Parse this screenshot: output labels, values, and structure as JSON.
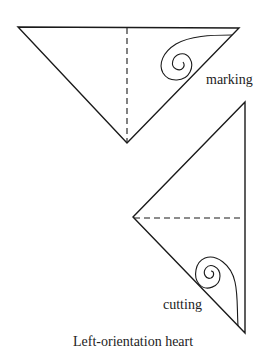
{
  "labels": {
    "marking": "marking",
    "cutting": "cutting",
    "caption": "Left-orientation heart"
  },
  "colors": {
    "stroke": "#1a1a1a",
    "background": "#ffffff"
  },
  "figures": [
    {
      "name": "marking-triangle",
      "description": "Folded triangle with dashed center fold and spiral heart pattern drawn"
    },
    {
      "name": "cutting-triangle",
      "description": "Rotated folded triangle with dashed fold and spiral cut line"
    }
  ]
}
